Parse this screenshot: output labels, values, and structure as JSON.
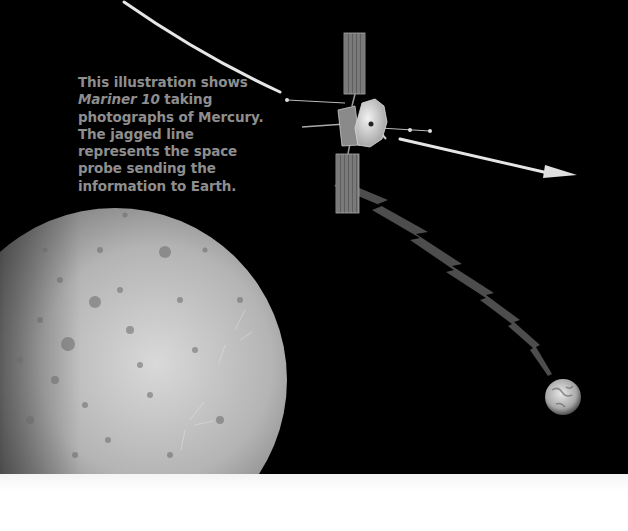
{
  "illustration": {
    "caption": {
      "part1": "This illustration shows ",
      "italic": "Mariner 10",
      "part2": " taking photographs of Mercury. The jagged line represents the space probe sending the information to Earth."
    },
    "elements": {
      "planet": "Mercury",
      "spacecraft": "Mariner 10",
      "destination": "Earth",
      "trajectory": "flight-path-arrow",
      "signal": "jagged-transmission-line"
    },
    "colors": {
      "background": "#000000",
      "caption_text": "#8e8e8e",
      "trajectory": "#e6e6e6",
      "bottom_strip": "#ffffff"
    }
  }
}
